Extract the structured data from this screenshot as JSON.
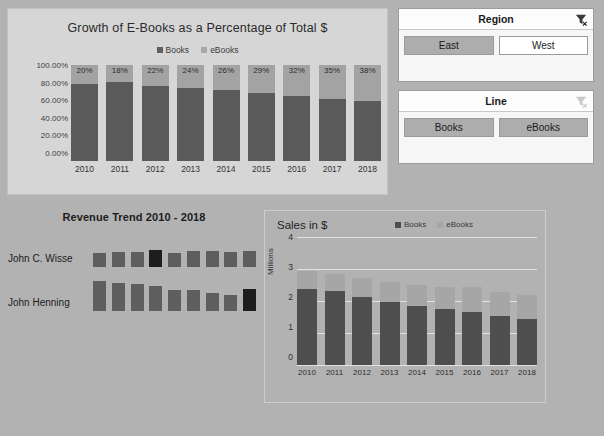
{
  "percent_chart": {
    "title": "Growth of E-Books as a Percentage of Total $",
    "legend": [
      {
        "label": "Books",
        "color": "#5a5a5a"
      },
      {
        "label": "eBooks",
        "color": "#a3a3a3"
      }
    ],
    "y_labels": [
      "100.00%",
      "80.00%",
      "60.00%",
      "40.00%",
      "20.00%",
      "0.00%"
    ]
  },
  "slicers": {
    "region": {
      "title": "Region",
      "clear_icon": "clear-filter-icon",
      "clear_enabled": true,
      "buttons": [
        {
          "label": "East",
          "selected": true
        },
        {
          "label": "West",
          "selected": false
        }
      ]
    },
    "line": {
      "title": "Line",
      "clear_icon": "clear-filter-icon",
      "clear_enabled": false,
      "buttons": [
        {
          "label": "Books",
          "selected": true
        },
        {
          "label": "eBooks",
          "selected": true
        }
      ]
    }
  },
  "revenue_trend": {
    "title": "Revenue Trend 2010 - 2018",
    "rows": [
      {
        "name": "John C. Wisse"
      },
      {
        "name": "John Henning"
      }
    ]
  },
  "sales_chart": {
    "title": "Sales in $",
    "y_axis_title": "Millions",
    "legend": [
      {
        "label": "Books",
        "color": "#4e4e4e"
      },
      {
        "label": "eBooks",
        "color": "#a6a6a6"
      }
    ],
    "y_labels": [
      "4",
      "3",
      "2",
      "1",
      "0"
    ]
  },
  "chart_data": [
    {
      "id": "percent-stacked-chart",
      "type": "bar",
      "stacked": "percent",
      "title": "Growth of E-Books as a Percentage of Total $",
      "xlabel": "",
      "ylabel": "",
      "ylim": [
        0,
        1
      ],
      "ytick_labels": [
        "0.00%",
        "20.00%",
        "40.00%",
        "60.00%",
        "80.00%",
        "100.00%"
      ],
      "grid": false,
      "legend_position": "top",
      "categories": [
        "2010",
        "2011",
        "2012",
        "2013",
        "2014",
        "2015",
        "2016",
        "2017",
        "2018"
      ],
      "series": [
        {
          "name": "Books",
          "color": "#5a5a5a",
          "values": [
            80,
            82,
            78,
            76,
            74,
            71,
            68,
            65,
            62
          ]
        },
        {
          "name": "eBooks",
          "color": "#a3a3a3",
          "values": [
            20,
            18,
            22,
            24,
            26,
            29,
            32,
            35,
            38
          ]
        }
      ],
      "data_labels": [
        "20%",
        "18%",
        "22%",
        "24%",
        "26%",
        "29%",
        "32%",
        "35%",
        "38%"
      ],
      "data_label_series": "eBooks"
    },
    {
      "id": "sales-stacked-chart",
      "type": "bar",
      "stacked": "value",
      "title": "Sales in $",
      "xlabel": "",
      "ylabel": "Millions",
      "ylim": [
        0,
        4
      ],
      "ytick_labels": [
        "0",
        "1",
        "2",
        "3",
        "4"
      ],
      "grid": true,
      "legend_position": "top-right",
      "categories": [
        "2010",
        "2011",
        "2012",
        "2013",
        "2014",
        "2015",
        "2016",
        "2017",
        "2018"
      ],
      "series": [
        {
          "name": "Books",
          "color": "#4e4e4e",
          "values": [
            2.38,
            2.32,
            2.13,
            1.96,
            1.86,
            1.74,
            1.66,
            1.52,
            1.44
          ]
        },
        {
          "name": "eBooks",
          "color": "#a6a6a6",
          "values": [
            0.55,
            0.51,
            0.6,
            0.62,
            0.65,
            0.71,
            0.78,
            0.75,
            0.76
          ]
        }
      ],
      "totals": [
        2.93,
        2.83,
        2.73,
        2.58,
        2.51,
        2.45,
        2.44,
        2.27,
        2.2
      ]
    },
    {
      "id": "revenue-trend-sparklines",
      "type": "bar",
      "title": "Revenue Trend 2010 - 2018",
      "subtype": "column-sparkline",
      "categories": [
        "2010",
        "2011",
        "2012",
        "2013",
        "2014",
        "2015",
        "2016",
        "2017",
        "2018"
      ],
      "series": [
        {
          "name": "John C. Wisse",
          "values": [
            12,
            13,
            13,
            15,
            12,
            14,
            14,
            13,
            14
          ],
          "highlight_index": 3,
          "highlight_color": "#1d1d1d",
          "color": "#5e5e5e"
        },
        {
          "name": "John Henning",
          "values": [
            26,
            24,
            23,
            22,
            18,
            18,
            16,
            14,
            19
          ],
          "highlight_index": 8,
          "highlight_color": "#1d1d1d",
          "color": "#5e5e5e"
        }
      ]
    }
  ]
}
